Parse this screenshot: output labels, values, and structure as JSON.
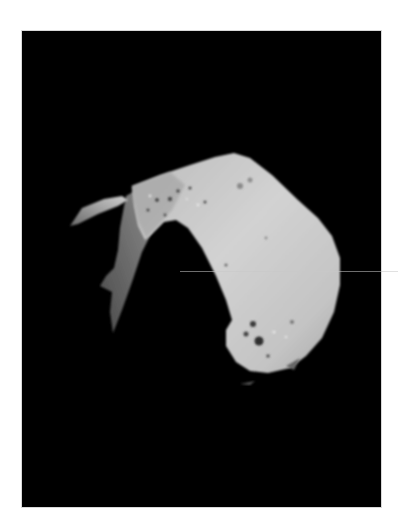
{
  "image": {
    "subject": "asteroid",
    "description": "Grayscale spacecraft photograph of a cratered, irregularly shaped asteroid against a black sky",
    "background_color": "#000000",
    "page_color": "#ffffff",
    "surface_light": "#cfcfcf",
    "surface_mid": "#9a9a9a",
    "surface_shadow": "#5a5a5a"
  }
}
